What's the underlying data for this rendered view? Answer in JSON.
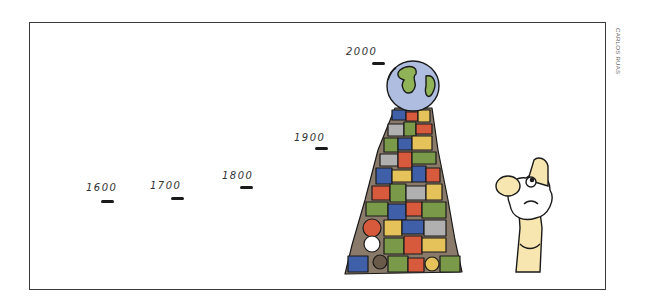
{
  "cartoon": {
    "credit": "CARLOS RUAS",
    "timeline": [
      {
        "label": "1600",
        "x": 86,
        "y": 182,
        "mx": 101,
        "my": 200
      },
      {
        "label": "1700",
        "x": 150,
        "y": 180,
        "mx": 171,
        "my": 197
      },
      {
        "label": "1800",
        "x": 222,
        "y": 170,
        "mx": 240,
        "my": 186
      },
      {
        "label": "1900",
        "x": 294,
        "y": 132,
        "mx": 315,
        "my": 147
      },
      {
        "label": "2000",
        "x": 346,
        "y": 46,
        "mx": 372,
        "my": 62
      }
    ],
    "scene": {
      "pile_of_objects": "tower of cluttered consumer goods",
      "globe_on_top": "Earth",
      "character": "bearded old man looking up"
    },
    "colors": {
      "border": "#3a3a3a",
      "globe_ocean": "#aebde0",
      "globe_land": "#8fb356",
      "skin": "#f7e6b0",
      "pile": [
        "#3f5fa8",
        "#d85a3c",
        "#7a9a4a",
        "#e6c35a",
        "#8a7a6a",
        "#b0b0b0"
      ]
    }
  }
}
